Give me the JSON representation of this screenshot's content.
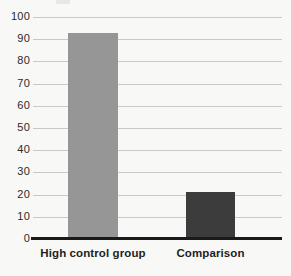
{
  "chart_data": {
    "type": "bar",
    "title": "",
    "subtitle": "",
    "xlabel": "",
    "ylabel": "",
    "categories": [
      "High control group",
      "Comparison"
    ],
    "values": [
      93,
      21
    ],
    "series": [
      {
        "name": "",
        "values": [
          93,
          21
        ]
      }
    ],
    "ylim": [
      0,
      100
    ],
    "ytick_values": [
      0,
      10,
      20,
      30,
      40,
      50,
      60,
      70,
      80,
      90,
      100
    ],
    "ytick_labels": [
      "0",
      "10",
      "20",
      "30",
      "40",
      "50",
      "60",
      "70",
      "80",
      "90",
      "100"
    ],
    "grid": true,
    "grid_axis": "y",
    "legend": false,
    "legend_position": "none",
    "bar_colors": [
      "#969696",
      "#3c3c3c"
    ],
    "annotations": []
  },
  "style": {
    "background_color": "#f8f8f6",
    "gridline_color": "#c9c9c7",
    "axis_color": "#1a1a1a",
    "tick_label_color": "#2b2b2b",
    "category_label_color": "#1f1f1f"
  }
}
